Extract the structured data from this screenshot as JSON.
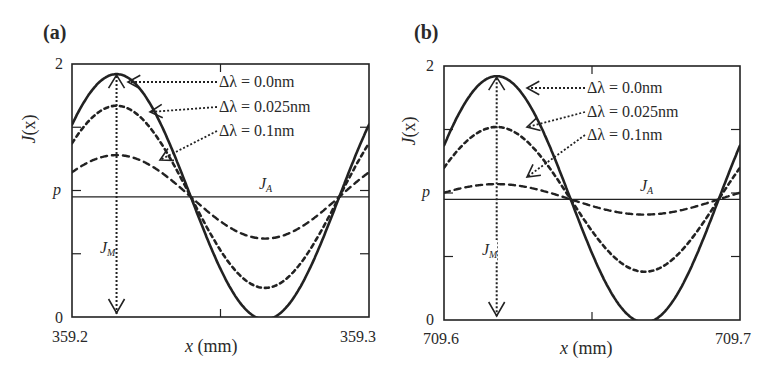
{
  "chart_data": [
    {
      "type": "line",
      "panel": "(a)",
      "title": "",
      "xlabel": "x (mm)",
      "ylabel": "J(x)",
      "xlim": [
        359.2,
        359.3
      ],
      "ylim": [
        0,
        2
      ],
      "x_ticks": [
        "359.2",
        "359.3"
      ],
      "y_ticks": [
        {
          "value": 0,
          "label": "0"
        },
        {
          "value": 1.0,
          "label": "p"
        },
        {
          "value": 2,
          "label": "2"
        }
      ],
      "grid": false,
      "model": "J(x) = J_A + A*cos(2*pi*(x - x_peak)/period)",
      "period_mm": 0.1,
      "x_peak_mm": 359.215,
      "reference_line": {
        "label": "J_A",
        "value": 0.95
      },
      "modulation_label": "J_M",
      "series": [
        {
          "name": "Δλ = 0.0nm",
          "style": "solid",
          "amplitude": 0.97,
          "max": 1.93,
          "min": 0.0
        },
        {
          "name": "Δλ = 0.025nm",
          "style": "dashed-dense",
          "amplitude": 0.72,
          "max": 1.68,
          "min": 0.23
        },
        {
          "name": "Δλ = 0.1nm",
          "style": "dashed",
          "amplitude": 0.33,
          "max": 1.29,
          "min": 0.63
        }
      ]
    },
    {
      "type": "line",
      "panel": "(b)",
      "title": "",
      "xlabel": "x (mm)",
      "ylabel": "J(x)",
      "xlim": [
        709.6,
        709.7
      ],
      "ylim": [
        0,
        2
      ],
      "x_ticks": [
        "709.6",
        "709.7"
      ],
      "y_ticks": [
        {
          "value": 0,
          "label": "0"
        },
        {
          "value": 1.0,
          "label": "p"
        },
        {
          "value": 2,
          "label": "2"
        }
      ],
      "grid": false,
      "model": "J(x) = J_A + A*cos(2*pi*(x - x_peak)/period)",
      "period_mm": 0.1,
      "x_peak_mm": 709.6178,
      "reference_line": {
        "label": "J_A",
        "value": 0.95
      },
      "modulation_label": "J_M",
      "series": [
        {
          "name": "Δλ = 0.0nm",
          "style": "solid",
          "amplitude": 0.97,
          "max": 1.93,
          "min": 0.0
        },
        {
          "name": "Δλ = 0.025nm",
          "style": "dashed-dense",
          "amplitude": 0.57,
          "max": 1.53,
          "min": 0.4
        },
        {
          "name": "Δλ = 0.1nm",
          "style": "dashed",
          "amplitude": 0.12,
          "max": 1.08,
          "min": 0.84
        }
      ]
    }
  ],
  "panels": {
    "a": {
      "label": "(a)",
      "ylabel_main": "J",
      "ylabel_paren": "(x)",
      "y_top": "2",
      "y_p": "p",
      "y_zero": "0",
      "x_left": "359.2",
      "x_right": "359.3",
      "xlabel_var": "x",
      "xlabel_unit": " (mm)",
      "ja_main": "J",
      "ja_sub": "A",
      "jm_main": "J",
      "jm_sub": "M",
      "legend": [
        "Δλ = 0.0nm",
        "Δλ = 0.025nm",
        "Δλ = 0.1nm"
      ]
    },
    "b": {
      "label": "(b)",
      "ylabel_main": "J",
      "ylabel_paren": "(x)",
      "y_top": "2",
      "y_p": "p",
      "y_zero": "0",
      "x_left": "709.6",
      "x_right": "709.7",
      "xlabel_var": "x",
      "xlabel_unit": " (mm)",
      "ja_main": "J",
      "ja_sub": "A",
      "jm_main": "J",
      "jm_sub": "M",
      "legend": [
        "Δλ = 0.0nm",
        "Δλ = 0.025nm",
        "Δλ = 0.1nm"
      ]
    }
  },
  "colors": {
    "ink": "#222222",
    "background": "#ffffff"
  }
}
